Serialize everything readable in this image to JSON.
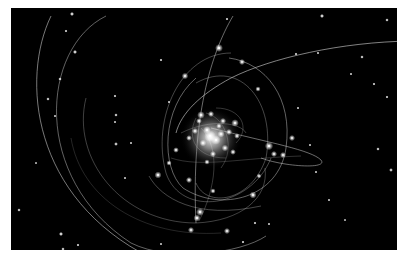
{
  "scene": {
    "subject": "Stellar orbits around a central compact object (galactic center star cluster)",
    "background_color": "#000000",
    "frame_color": "#ffffff",
    "panel": {
      "x": 11,
      "y": 8,
      "width": 386,
      "height": 242
    },
    "orbit_color": "#d8d8d8",
    "star_color": "#ffffff",
    "core": {
      "cx": 200,
      "cy": 130,
      "r": 14
    },
    "orbits": [
      {
        "d": "M 40 8 C 10 70, 20 190, 140 250",
        "w": 0.8,
        "o": 0.7
      },
      {
        "d": "M 95 8 C 30 40, 20 170, 120 235 C 160 255, 230 245, 255 228",
        "w": 0.7,
        "o": 0.65
      },
      {
        "d": "M 75 90 C 60 150, 110 215, 185 215 C 230 213, 258 190, 254 160",
        "w": 0.6,
        "o": 0.5
      },
      {
        "d": "M 400 33 C 330 34, 260 50, 220 70 C 190 86, 170 105, 165 125",
        "w": 0.8,
        "o": 0.75
      },
      {
        "d": "M 222 8 C 200 45, 180 110, 185 215",
        "w": 0.7,
        "o": 0.7
      },
      {
        "d": "M 200 120 C 260 135, 300 142, 310 152 C 318 162, 270 158, 250 150",
        "w": 0.7,
        "o": 0.7
      },
      {
        "d": "M 218 50 C 255 55, 282 90, 275 140 C 268 190, 210 205, 172 180 C 150 160, 150 100, 185 70",
        "w": 0.7,
        "o": 0.65
      },
      {
        "d": "M 220 45 C 170 45, 140 110, 155 165 C 170 210, 240 200, 260 150",
        "w": 0.6,
        "o": 0.55
      },
      {
        "d": "M 185 75 C 230 50, 265 95, 255 150 C 240 195, 195 200, 185 175",
        "w": 0.6,
        "o": 0.55
      },
      {
        "d": "M 138 168 C 150 190, 185 212, 250 198",
        "w": 0.6,
        "o": 0.55
      },
      {
        "d": "M 160 150 C 190 160, 230 150, 290 148",
        "w": 0.5,
        "o": 0.45
      },
      {
        "d": "M 190 120 C 210 140, 205 180, 188 213",
        "w": 0.5,
        "o": 0.5
      },
      {
        "d": "M 170 125 C 200 110, 230 115, 235 125",
        "w": 0.5,
        "o": 0.55
      },
      {
        "d": "M 195 105 C 215 110, 225 140, 210 160",
        "w": 0.5,
        "o": 0.5
      },
      {
        "d": "M 185 110 C 175 130, 185 150, 215 150",
        "w": 0.5,
        "o": 0.5
      },
      {
        "d": "M 205 100 C 230 100, 240 120, 225 135",
        "w": 0.5,
        "o": 0.5
      },
      {
        "d": "M 60 130 C 70 190, 130 230, 210 225",
        "w": 0.5,
        "o": 0.35
      }
    ],
    "cluster_stars": [
      {
        "x": 199,
        "y": 128,
        "r": 2.4
      },
      {
        "x": 205,
        "y": 132,
        "r": 2.0
      },
      {
        "x": 196,
        "y": 122,
        "r": 1.6
      },
      {
        "x": 210,
        "y": 126,
        "r": 1.5
      },
      {
        "x": 192,
        "y": 135,
        "r": 1.4
      },
      {
        "x": 190,
        "y": 107,
        "r": 1.6
      },
      {
        "x": 200,
        "y": 106,
        "r": 1.3
      },
      {
        "x": 212,
        "y": 113,
        "r": 1.3
      },
      {
        "x": 224,
        "y": 115,
        "r": 1.6
      },
      {
        "x": 218,
        "y": 124,
        "r": 1.3
      },
      {
        "x": 226,
        "y": 128,
        "r": 1.2
      },
      {
        "x": 184,
        "y": 123,
        "r": 1.3
      },
      {
        "x": 178,
        "y": 130,
        "r": 1.2
      },
      {
        "x": 214,
        "y": 140,
        "r": 1.4
      },
      {
        "x": 222,
        "y": 144,
        "r": 1.2
      },
      {
        "x": 202,
        "y": 146,
        "r": 1.3
      },
      {
        "x": 188,
        "y": 113,
        "r": 1.2
      },
      {
        "x": 208,
        "y": 118,
        "r": 1.2
      }
    ],
    "orbit_stars": [
      {
        "x": 208,
        "y": 40,
        "r": 1.8
      },
      {
        "x": 231,
        "y": 54,
        "r": 1.4
      },
      {
        "x": 174,
        "y": 68,
        "r": 1.5
      },
      {
        "x": 247,
        "y": 81,
        "r": 1.2
      },
      {
        "x": 258,
        "y": 138,
        "r": 1.9
      },
      {
        "x": 281,
        "y": 130,
        "r": 1.4
      },
      {
        "x": 263,
        "y": 146,
        "r": 1.4
      },
      {
        "x": 272,
        "y": 147,
        "r": 1.4
      },
      {
        "x": 165,
        "y": 142,
        "r": 1.3
      },
      {
        "x": 147,
        "y": 167,
        "r": 1.6
      },
      {
        "x": 158,
        "y": 155,
        "r": 1.2
      },
      {
        "x": 178,
        "y": 172,
        "r": 1.4
      },
      {
        "x": 202,
        "y": 183,
        "r": 1.2
      },
      {
        "x": 242,
        "y": 187,
        "r": 1.6
      },
      {
        "x": 189,
        "y": 204,
        "r": 1.8
      },
      {
        "x": 186,
        "y": 210,
        "r": 1.6
      },
      {
        "x": 180,
        "y": 222,
        "r": 1.4
      },
      {
        "x": 216,
        "y": 223,
        "r": 1.4
      },
      {
        "x": 248,
        "y": 168,
        "r": 1.1
      },
      {
        "x": 196,
        "y": 154,
        "r": 1.2
      }
    ],
    "field_stars": [
      {
        "x": 61,
        "y": 6,
        "r": 1.2
      },
      {
        "x": 64,
        "y": 44,
        "r": 1.2
      },
      {
        "x": 55,
        "y": 23,
        "r": 0.9
      },
      {
        "x": 49,
        "y": 71,
        "r": 1.0
      },
      {
        "x": 37,
        "y": 91,
        "r": 1.0
      },
      {
        "x": 104,
        "y": 88,
        "r": 0.9
      },
      {
        "x": 105,
        "y": 107,
        "r": 1.0
      },
      {
        "x": 105,
        "y": 136,
        "r": 1.1
      },
      {
        "x": 104,
        "y": 114,
        "r": 0.8
      },
      {
        "x": 120,
        "y": 135,
        "r": 0.8
      },
      {
        "x": 8,
        "y": 202,
        "r": 1.0
      },
      {
        "x": 50,
        "y": 226,
        "r": 1.2
      },
      {
        "x": 52,
        "y": 241,
        "r": 1.0
      },
      {
        "x": 67,
        "y": 237,
        "r": 0.9
      },
      {
        "x": 150,
        "y": 52,
        "r": 0.9
      },
      {
        "x": 158,
        "y": 94,
        "r": 0.8
      },
      {
        "x": 216,
        "y": 11,
        "r": 0.9
      },
      {
        "x": 311,
        "y": 8,
        "r": 1.2
      },
      {
        "x": 376,
        "y": 12,
        "r": 1.0
      },
      {
        "x": 285,
        "y": 46,
        "r": 0.9
      },
      {
        "x": 307,
        "y": 45,
        "r": 0.8
      },
      {
        "x": 351,
        "y": 49,
        "r": 1.0
      },
      {
        "x": 340,
        "y": 66,
        "r": 0.8
      },
      {
        "x": 363,
        "y": 76,
        "r": 0.9
      },
      {
        "x": 376,
        "y": 89,
        "r": 0.9
      },
      {
        "x": 287,
        "y": 100,
        "r": 0.8
      },
      {
        "x": 299,
        "y": 137,
        "r": 0.8
      },
      {
        "x": 367,
        "y": 141,
        "r": 1.0
      },
      {
        "x": 305,
        "y": 164,
        "r": 0.8
      },
      {
        "x": 380,
        "y": 162,
        "r": 1.1
      },
      {
        "x": 318,
        "y": 192,
        "r": 0.8
      },
      {
        "x": 244,
        "y": 215,
        "r": 0.9
      },
      {
        "x": 232,
        "y": 234,
        "r": 0.9
      },
      {
        "x": 258,
        "y": 216,
        "r": 0.8
      },
      {
        "x": 334,
        "y": 212,
        "r": 0.7
      },
      {
        "x": 44,
        "y": 108,
        "r": 0.8
      },
      {
        "x": 25,
        "y": 155,
        "r": 0.7
      },
      {
        "x": 114,
        "y": 170,
        "r": 0.8
      },
      {
        "x": 150,
        "y": 236,
        "r": 0.8
      }
    ]
  }
}
